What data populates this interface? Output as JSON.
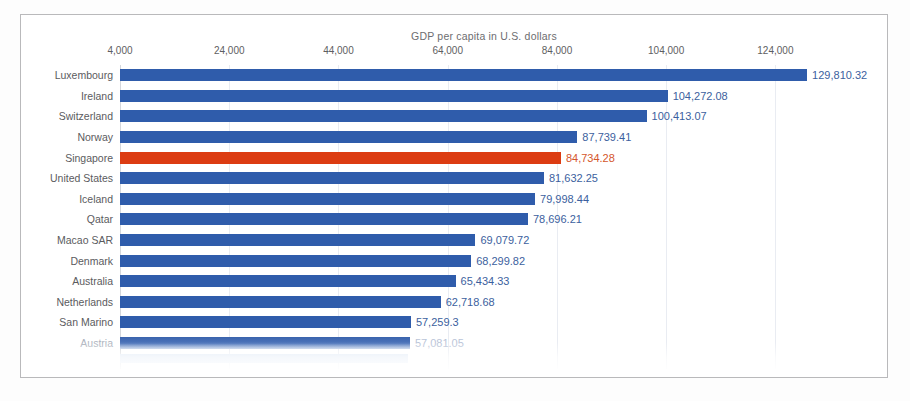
{
  "chart_data": {
    "type": "bar",
    "orientation": "horizontal",
    "title": "GDP per capita in U.S. dollars",
    "xlabel": "",
    "ylabel": "",
    "xlim": [
      4000,
      134000
    ],
    "axis_start": 4000,
    "grid": true,
    "legend": "none",
    "tick_labels": [
      "4,000",
      "24,000",
      "44,000",
      "64,000",
      "84,000",
      "104,000",
      "124,000"
    ],
    "tick_values": [
      4000,
      24000,
      44000,
      64000,
      84000,
      104000,
      124000
    ],
    "highlight_category": "Singapore",
    "colors": {
      "bar": "#2f5cab",
      "highlight_bar": "#dc3c12",
      "value_label": "#3c5f9e",
      "highlight_value_label": "#d4562c",
      "category_label": "#5b5b5e",
      "title": "#6d6d70",
      "gridline": "#e9ecf2",
      "frame": "#b9b9bb"
    },
    "categories": [
      "Luxembourg",
      "Ireland",
      "Switzerland",
      "Norway",
      "Singapore",
      "United States",
      "Iceland",
      "Qatar",
      "Macao SAR",
      "Denmark",
      "Australia",
      "Netherlands",
      "San Marino",
      "Austria"
    ],
    "values": [
      129810.32,
      104272.08,
      100413.07,
      87739.41,
      84734.28,
      81632.25,
      79998.44,
      78696.21,
      69079.72,
      68299.82,
      65434.33,
      62718.68,
      57259.3,
      57081.05
    ],
    "value_labels": [
      "129,810.32",
      "104,272.08",
      "100,413.07",
      "87,739.41",
      "84,734.28",
      "81,632.25",
      "79,998.44",
      "78,696.21",
      "69,079.72",
      "68,299.82",
      "65,434.33",
      "62,718.68",
      "57,259.3",
      "57,081.05"
    ],
    "clipped_last_row": true
  }
}
